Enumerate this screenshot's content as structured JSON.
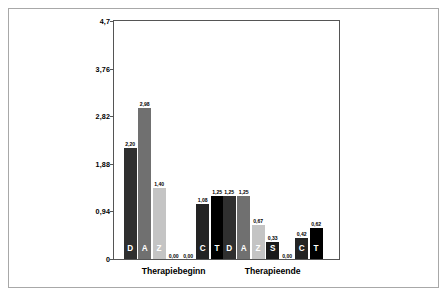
{
  "figure": {
    "background": "#ffffff",
    "frame_color": "#a8a8a8",
    "axis_color": "#555555"
  },
  "chart_data": {
    "type": "bar",
    "title": "",
    "subtitle": "",
    "xlabel": "",
    "ylabel": "",
    "categories": [
      "Therapiebeginn",
      "Therapieende"
    ],
    "ylim": [
      0,
      4.7
    ],
    "yticks": [
      0,
      0.94,
      1.88,
      2.82,
      3.76,
      4.7
    ],
    "ytick_labels": [
      "0",
      "0,94",
      "1,88",
      "2,82",
      "3,76",
      "4,7"
    ],
    "grid": false,
    "legend": "none",
    "decimal_separator": ",",
    "series": [
      {
        "name": "D",
        "letter": "D",
        "color": "#2f2f2f",
        "label_color": "#ffffff",
        "values": [
          2.2,
          1.25
        ],
        "value_labels": [
          "2,20",
          "1,25"
        ]
      },
      {
        "name": "A",
        "letter": "A",
        "color": "#707070",
        "label_color": "#ffffff",
        "values": [
          2.98,
          1.25
        ],
        "value_labels": [
          "2,98",
          "1,25"
        ]
      },
      {
        "name": "Z",
        "letter": "Z",
        "color": "#c4c4c4",
        "label_color": "#ffffff",
        "values": [
          1.4,
          0.67
        ],
        "value_labels": [
          "1,40",
          "0,67"
        ]
      },
      {
        "name": "S",
        "letter": "S",
        "color": "#1a1a1a",
        "label_color": "#ffffff",
        "values": [
          0.0,
          0.33
        ],
        "value_labels": [
          "0,00",
          "0,33"
        ]
      },
      {
        "name": "C",
        "letter": "C",
        "color": "#232323",
        "label_color": "#ffffff",
        "values": [
          0.0,
          0.42
        ],
        "value_labels": [
          "0,00",
          "0,42"
        ]
      },
      {
        "name": "C2",
        "letter": "C",
        "color": "#232323",
        "label_color": "#ffffff",
        "values": [
          1.08,
          0.0
        ],
        "value_labels": [
          "1,08",
          "0,00"
        ]
      },
      {
        "name": "T",
        "letter": "T",
        "color": "#000000",
        "label_color": "#ffffff",
        "values": [
          1.25,
          0.62
        ],
        "value_labels": [
          "1,25",
          "0,62"
        ]
      }
    ],
    "groups": [
      {
        "category": "Therapiebeginn",
        "bars": [
          {
            "letter": "D",
            "value": 2.2,
            "value_label": "2,20",
            "color": "#2f2f2f",
            "show_letter": true
          },
          {
            "letter": "A",
            "value": 2.98,
            "value_label": "2,98",
            "color": "#707070",
            "show_letter": true
          },
          {
            "letter": "Z",
            "value": 1.4,
            "value_label": "1,40",
            "color": "#c4c4c4",
            "show_letter": true
          },
          {
            "letter": "S",
            "value": 0.0,
            "value_label": "0,00",
            "color": "#1a1a1a",
            "show_letter": false
          },
          {
            "letter": "",
            "value": 0.0,
            "value_label": "0,00",
            "color": "#1a1a1a",
            "show_letter": false
          },
          {
            "letter": "C",
            "value": 1.08,
            "value_label": "1,08",
            "color": "#232323",
            "show_letter": true
          },
          {
            "letter": "T",
            "value": 1.25,
            "value_label": "1,25",
            "color": "#000000",
            "show_letter": true
          }
        ]
      },
      {
        "category": "Therapieende",
        "bars": [
          {
            "letter": "D",
            "value": 1.25,
            "value_label": "1,25",
            "color": "#2f2f2f",
            "show_letter": true
          },
          {
            "letter": "A",
            "value": 1.25,
            "value_label": "1,25",
            "color": "#707070",
            "show_letter": true
          },
          {
            "letter": "Z",
            "value": 0.67,
            "value_label": "0,67",
            "color": "#c4c4c4",
            "show_letter": true
          },
          {
            "letter": "S",
            "value": 0.33,
            "value_label": "0,33",
            "color": "#1a1a1a",
            "show_letter": true
          },
          {
            "letter": "",
            "value": 0.0,
            "value_label": "0,00",
            "color": "#1a1a1a",
            "show_letter": false
          },
          {
            "letter": "C",
            "value": 0.42,
            "value_label": "0,42",
            "color": "#232323",
            "show_letter": true
          },
          {
            "letter": "T",
            "value": 0.62,
            "value_label": "0,62",
            "color": "#000000",
            "show_letter": true
          }
        ]
      }
    ]
  }
}
